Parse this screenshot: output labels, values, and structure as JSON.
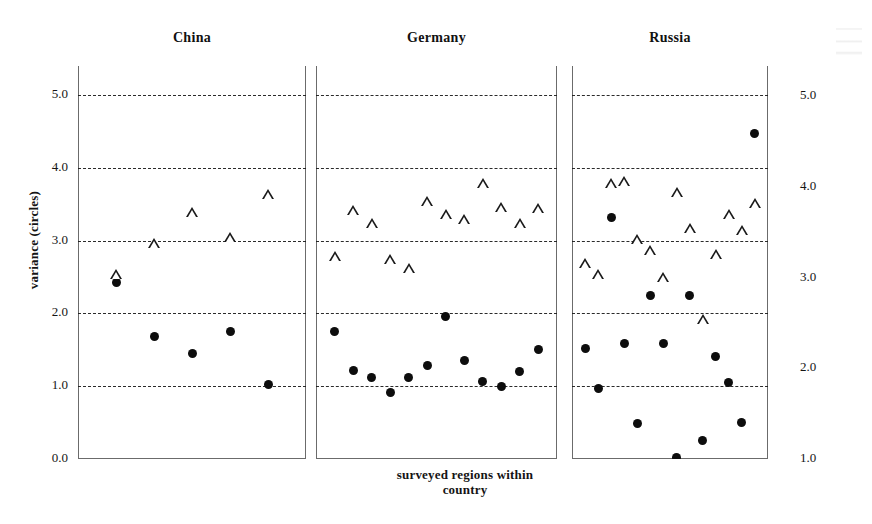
{
  "figure": {
    "background_color": "#ffffff",
    "marker_color": "#111111"
  },
  "axes": {
    "left": {
      "title": "variance (circles)",
      "ticks": [
        "0.0",
        "1.0",
        "2.0",
        "3.0",
        "4.0",
        "5.0"
      ],
      "range": [
        0.0,
        5.0
      ]
    },
    "right": {
      "title": "group mean (triangles)",
      "ticks": [
        "1.0",
        "2.0",
        "3.0",
        "4.0",
        "5.0"
      ],
      "range": [
        1.0,
        5.0
      ]
    },
    "x": {
      "title_line1": "surveyed regions within",
      "title_line2": "country",
      "title": "surveyed regions within country"
    }
  },
  "panels": [
    {
      "title": "China"
    },
    {
      "title": "Germany"
    },
    {
      "title": "Russia"
    }
  ],
  "chart_data": {
    "type": "scatter",
    "title": "",
    "xlabel": "surveyed regions within country",
    "ylabel": "variance (circles)",
    "ylabel_right": "group mean (triangles)",
    "ylim": [
      0.0,
      5.0
    ],
    "ylim_right": [
      1.0,
      5.0
    ],
    "grid": true,
    "gridlines": [
      1.0,
      2.0,
      3.0,
      4.0,
      5.0
    ],
    "legend": "none",
    "marker_encoding": {
      "circles": "variance (left axis)",
      "triangles": "group mean (right axis)"
    },
    "panels": [
      {
        "name": "China",
        "n_regions": 5,
        "series": [
          {
            "name": "variance",
            "marker": "circle",
            "axis": "left",
            "x": [
              1,
              2,
              3,
              4,
              5
            ],
            "values": [
              2.42,
              1.68,
              1.45,
              1.75,
              1.02
            ]
          },
          {
            "name": "group mean",
            "marker": "triangle",
            "axis": "right",
            "x": [
              1,
              2,
              3,
              4,
              5
            ],
            "values": [
              2.92,
              3.26,
              3.6,
              3.33,
              3.8
            ]
          }
        ]
      },
      {
        "name": "Germany",
        "n_regions": 12,
        "series": [
          {
            "name": "variance",
            "marker": "circle",
            "axis": "left",
            "x": [
              1,
              2,
              3,
              4,
              5,
              6,
              7,
              8,
              9,
              10,
              11,
              12
            ],
            "values": [
              1.75,
              1.22,
              1.12,
              0.92,
              1.12,
              1.28,
              1.96,
              1.35,
              1.07,
              0.99,
              1.2,
              1.5
            ]
          },
          {
            "name": "group mean",
            "marker": "triangle",
            "axis": "right",
            "x": [
              1,
              2,
              3,
              4,
              5,
              6,
              7,
              8,
              9,
              10,
              11,
              12
            ],
            "values": [
              3.12,
              3.62,
              3.48,
              3.08,
              2.98,
              3.72,
              3.58,
              3.52,
              3.92,
              3.66,
              3.48,
              3.65
            ]
          }
        ]
      },
      {
        "name": "Russia",
        "n_regions": 14,
        "series": [
          {
            "name": "variance",
            "marker": "circle",
            "axis": "left",
            "x": [
              1,
              2,
              3,
              4,
              5,
              6,
              7,
              8,
              9,
              10,
              11,
              12,
              13,
              14
            ],
            "values": [
              1.52,
              0.97,
              3.32,
              1.58,
              0.49,
              2.25,
              1.58,
              0.02,
              2.25,
              0.25,
              1.41,
              1.05,
              0.5,
              4.47
            ]
          },
          {
            "name": "group mean",
            "marker": "triangle",
            "axis": "right",
            "x": [
              1,
              2,
              3,
              4,
              5,
              6,
              7,
              8,
              9,
              10,
              11,
              12,
              13,
              14
            ],
            "values": [
              3.04,
              2.92,
              3.92,
              3.94,
              3.3,
              3.18,
              2.88,
              3.82,
              3.42,
              2.42,
              3.14,
              3.58,
              3.4,
              3.7
            ]
          }
        ]
      }
    ]
  }
}
